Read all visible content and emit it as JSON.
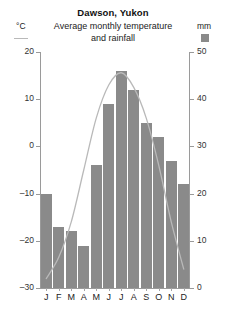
{
  "header": {
    "title": "Dawson, Yukon",
    "subtitle_line1": "Average monthly temperature",
    "subtitle_line2": "and rainfall",
    "unit_left": "°C",
    "unit_right": "mm",
    "legend_line_name": "temperature-legend-line",
    "legend_swatch_name": "rainfall-legend-swatch",
    "swatch_color": "#8a8a8a",
    "line_color": "#b9b9b9"
  },
  "chart_data": {
    "type": "bar",
    "title": "Dawson, Yukon",
    "subtitle": "Average monthly temperature and rainfall",
    "categories": [
      "J",
      "F",
      "M",
      "A",
      "M",
      "J",
      "J",
      "A",
      "S",
      "O",
      "N",
      "D"
    ],
    "xlabel": "",
    "grid": false,
    "legend": "top",
    "axes": {
      "left": {
        "label": "°C",
        "ticks": [
          20,
          10,
          0,
          -10,
          -20,
          -30
        ],
        "tick_labels": [
          "20",
          "10",
          "0",
          "–10",
          "–20",
          "–30"
        ],
        "range": [
          -30,
          20
        ]
      },
      "right": {
        "label": "mm",
        "ticks": [
          50,
          40,
          30,
          20,
          10,
          0
        ],
        "tick_labels": [
          "50",
          "40",
          "30",
          "20",
          "10",
          "0"
        ],
        "range": [
          0,
          50
        ]
      }
    },
    "series": [
      {
        "name": "rainfall",
        "type": "bar",
        "unit": "mm",
        "axis": "right",
        "color": "#8a8a8a",
        "values": [
          20,
          13,
          12,
          9,
          26,
          39,
          46,
          42,
          35,
          32,
          27,
          22
        ]
      },
      {
        "name": "temperature",
        "type": "line",
        "unit": "°C",
        "axis": "left",
        "color": "#b9b9b9",
        "values": [
          -28,
          -23.5,
          -16,
          -5,
          6,
          13,
          15.6,
          12.5,
          6,
          -4,
          -16,
          -26
        ]
      }
    ]
  }
}
